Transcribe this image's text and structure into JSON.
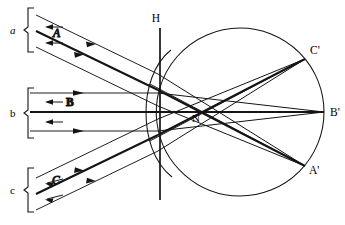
{
  "diagram": {
    "stroke_color": "#141414",
    "background": "#ffffff",
    "labels": {
      "bundle_a": "a",
      "bundle_b": "b",
      "bundle_c": "c",
      "ray_a": "A",
      "ray_b": "B",
      "ray_c": "C",
      "principal_plane": "H",
      "nodal_point": "N",
      "image_a": "A'",
      "image_b": "B'",
      "image_c": "C'"
    },
    "geometry": {
      "globe_center_x": 240,
      "globe_center_y": 112,
      "globe_radius": 84,
      "cornea_apex_x": 146,
      "principal_line_x": 160,
      "principal_line_y_top": 28,
      "principal_line_y_bottom": 200,
      "nodal_x": 196,
      "nodal_y": 118,
      "image_a_x": 305,
      "image_a_y": 166,
      "image_b_x": 324,
      "image_b_y": 112,
      "image_c_x": 305,
      "image_c_y": 59
    },
    "bundles": [
      {
        "id": "a",
        "label": "a",
        "ray_label": "A",
        "direction": "down-right",
        "converges_to": "A'",
        "bracket": {
          "x": 30,
          "y_top": 8,
          "y_bottom": 52,
          "label_x": 11,
          "label_y": 33
        },
        "rays": [
          {
            "x1": 38,
            "y1": 16,
            "x2": 156,
            "y2": 73
          },
          {
            "x1": 38,
            "y1": 32,
            "x2": 156,
            "y2": 90
          },
          {
            "x1": 38,
            "y1": 48,
            "x2": 156,
            "y2": 106
          }
        ],
        "arrowheads": [
          {
            "x": 95,
            "y": 44,
            "angle": 26
          },
          {
            "x": 80,
            "y": 52,
            "angle": 26
          }
        ],
        "reverse_arrows": [
          {
            "x": 48,
            "y": 27,
            "len": 16
          },
          {
            "x": 48,
            "y": 43,
            "len": 16
          }
        ]
      },
      {
        "id": "b",
        "label": "b",
        "ray_label": "B",
        "direction": "horizontal",
        "converges_to": "B'",
        "bracket": {
          "x": 30,
          "y_top": 88,
          "y_bottom": 138,
          "label_x": 11,
          "label_y": 116
        },
        "rays": [
          {
            "x1": 38,
            "y1": 93,
            "x2": 156,
            "y2": 93
          },
          {
            "x1": 38,
            "y1": 112,
            "x2": 156,
            "y2": 112
          },
          {
            "x1": 38,
            "y1": 131,
            "x2": 156,
            "y2": 131
          }
        ],
        "arrowheads": [
          {
            "x": 82,
            "y": 93,
            "angle": 0
          },
          {
            "x": 82,
            "y": 131,
            "angle": 0
          }
        ],
        "reverse_arrows": [
          {
            "x": 48,
            "y": 103,
            "len": 16
          },
          {
            "x": 48,
            "y": 122,
            "len": 16
          }
        ]
      },
      {
        "id": "c",
        "label": "c",
        "ray_label": "C",
        "direction": "up-right",
        "converges_to": "C'",
        "bracket": {
          "x": 30,
          "y_top": 168,
          "y_bottom": 212,
          "label_x": 11,
          "label_y": 192
        },
        "rays": [
          {
            "x1": 38,
            "y1": 209,
            "x2": 156,
            "y2": 152
          },
          {
            "x1": 38,
            "y1": 193,
            "x2": 156,
            "y2": 135
          },
          {
            "x1": 38,
            "y1": 177,
            "x2": 156,
            "y2": 119
          }
        ],
        "arrowheads": [
          {
            "x": 95,
            "y": 181,
            "angle": -26
          },
          {
            "x": 80,
            "y": 173,
            "angle": -26
          }
        ],
        "reverse_arrows": [
          {
            "x": 48,
            "y": 198,
            "len": 16
          },
          {
            "x": 48,
            "y": 182,
            "len": 16
          }
        ]
      }
    ]
  }
}
